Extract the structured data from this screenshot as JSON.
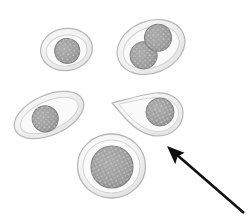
{
  "figure": {
    "background_color": "#ffffff",
    "width": 249,
    "height": 219,
    "caption": ""
  },
  "palette": {
    "cytoplasm_fill_light": "#f4f4f4",
    "cytoplasm_fill_mid": "#e9e9e9",
    "cytoplasm_fill_edge": "#dcdcdc",
    "membrane_stroke": "#b6b6b6",
    "inner_ring_stroke": "#d2d2d2",
    "nucleus_fill": "#9b9b9b",
    "nucleus_stroke": "#7d7d7d",
    "nucleus_speckle": "#d8d8d8",
    "arrow_color": "#111111"
  },
  "cells": [
    {
      "id": "cell-oval-small",
      "label": "Small oval cell",
      "shape": "ellipse",
      "cx": 66.5,
      "cy": 49.5,
      "rx": 26,
      "ry": 21,
      "rotation": -8,
      "nuclei": [
        {
          "cx": 67,
          "cy": 51,
          "r": 12.5
        }
      ]
    },
    {
      "id": "cell-binucleate",
      "label": "Binucleated cell",
      "shape": "ellipse",
      "cx": 151,
      "cy": 47,
      "rx": 35,
      "ry": 26,
      "rotation": -22,
      "nuclei": [
        {
          "cx": 141,
          "cy": 52,
          "r": 13.5
        },
        {
          "cx": 161,
          "cy": 41,
          "r": 13.5
        }
      ]
    },
    {
      "id": "cell-elongated",
      "label": "Elongated spindle cell",
      "shape": "ellipse",
      "cx": 49,
      "cy": 115,
      "rx": 37,
      "ry": 20,
      "rotation": -24,
      "nuclei": [
        {
          "cx": 44,
          "cy": 117,
          "r": 13
        }
      ]
    },
    {
      "id": "cell-teardrop",
      "label": "Teardrop / comma shaped cell",
      "shape": "teardrop",
      "nuclei": [
        {
          "cx": 160,
          "cy": 112,
          "r": 14
        }
      ]
    },
    {
      "id": "cell-large-round",
      "label": "Large round cell",
      "shape": "ellipse",
      "cx": 111.5,
      "cy": 166,
      "rx": 34,
      "ry": 32,
      "rotation": 0,
      "nuclei": [
        {
          "cx": 112,
          "cy": 167,
          "r": 21
        }
      ]
    }
  ],
  "annotation": {
    "arrow": {
      "name": "pointer-arrow",
      "tip_x": 167,
      "tip_y": 146,
      "tail_x": 244,
      "tail_y": 213,
      "color": "#111111",
      "stroke_width": 2.6,
      "head_length": 20,
      "head_width": 15
    }
  }
}
